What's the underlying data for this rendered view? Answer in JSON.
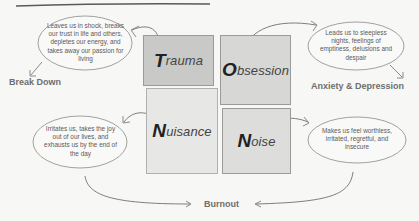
{
  "diagram": {
    "quadrants": [
      {
        "key": "trauma",
        "initial": "T",
        "rest": "rauma",
        "fill": "#c8c8c8"
      },
      {
        "key": "obsession",
        "initial": "O",
        "rest": "bsession",
        "fill": "#d6d6d6"
      },
      {
        "key": "nuisance",
        "initial": "N",
        "rest": "uisance",
        "fill": "#e8e8e7"
      },
      {
        "key": "noise",
        "initial": "N",
        "rest": "oise",
        "fill": "#dcdcdc"
      }
    ],
    "bubbles": {
      "trauma": "Leaves us in shock, breaks our trust in life and others, depletes our energy, and takes away our passion for living",
      "obsession": "Leads us to sleepless nights, feelings of emptiness, delusions and despair",
      "nuisance": "Irritates us, takes the joy out of our lives, and exhausts us by the end of the day",
      "noise": "Makes us feel worthless, irritated, regretful, and insecure"
    },
    "outcomes": {
      "trauma": "Break Down",
      "obsession": "Anxiety & Depression",
      "shared_bottom": "Burnout"
    },
    "colors": {
      "line": "#8c8c8c",
      "header_rule": "#555555",
      "text": "#5a5a5a"
    }
  }
}
